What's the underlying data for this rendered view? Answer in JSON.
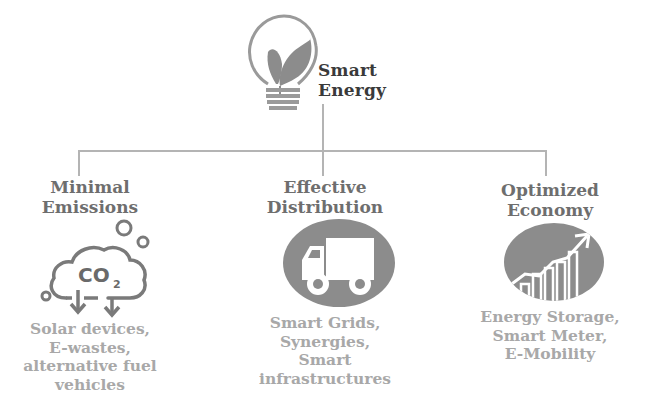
{
  "root": {
    "title_line1": "Smart",
    "title_line2": "Energy",
    "icon": "lightbulb-leaf-icon"
  },
  "branches": [
    {
      "heading_line1": "Minimal",
      "heading_line2": "Emissions",
      "icon": "co2-cloud-icon",
      "icon_text": "CO",
      "icon_subscript": "2",
      "desc_lines": [
        "Solar devices,",
        "E-wastes,",
        "alternative fuel",
        "vehicles"
      ]
    },
    {
      "heading_line1": "Effective",
      "heading_line2": "Distribution",
      "icon": "truck-icon",
      "desc_lines": [
        "Smart Grids,",
        "Synergies,",
        "Smart",
        "infrastructures"
      ]
    },
    {
      "heading_line1": "Optimized",
      "heading_line2": "Economy",
      "icon": "growth-chart-icon",
      "desc_lines": [
        "Energy Storage,",
        "Smart Meter,",
        "E-Mobility"
      ]
    }
  ],
  "colors": {
    "connector": "#b4b4b4",
    "heading": "#6e6e6e",
    "description": "#a8a8a8",
    "icon_fill": "#8c8c8c",
    "root_title": "#3a3a3a"
  }
}
